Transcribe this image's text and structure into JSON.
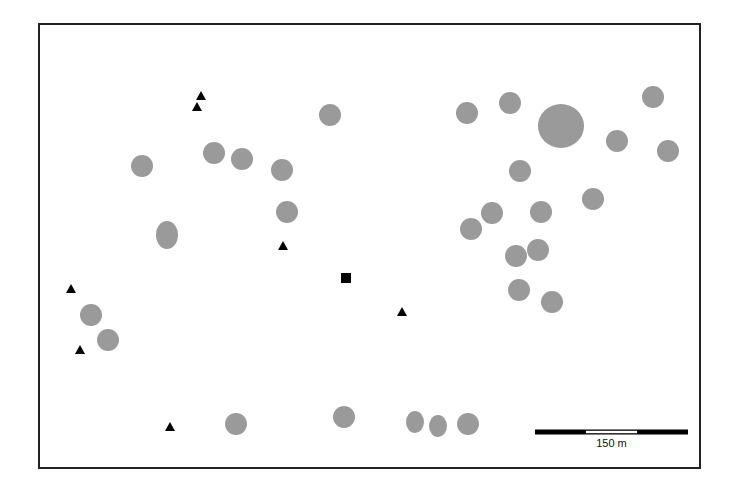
{
  "map": {
    "frame": {
      "x": 39,
      "y": 24,
      "width": 661,
      "height": 444
    },
    "colors": {
      "site": "#9a9a9a",
      "marker": "#000000",
      "frame": "#222222"
    },
    "sites": [
      {
        "x": 330,
        "y": 115,
        "rx": 11,
        "ry": 11
      },
      {
        "x": 142,
        "y": 166,
        "rx": 11,
        "ry": 11
      },
      {
        "x": 214,
        "y": 153,
        "rx": 11,
        "ry": 11
      },
      {
        "x": 242,
        "y": 159,
        "rx": 11,
        "ry": 11
      },
      {
        "x": 282,
        "y": 170,
        "rx": 11,
        "ry": 11
      },
      {
        "x": 287,
        "y": 212,
        "rx": 11,
        "ry": 11
      },
      {
        "x": 167,
        "y": 235,
        "rx": 11,
        "ry": 14
      },
      {
        "x": 91,
        "y": 315,
        "rx": 11,
        "ry": 11
      },
      {
        "x": 108,
        "y": 340,
        "rx": 11,
        "ry": 11
      },
      {
        "x": 467,
        "y": 113,
        "rx": 11,
        "ry": 11
      },
      {
        "x": 510,
        "y": 103,
        "rx": 11,
        "ry": 11
      },
      {
        "x": 561,
        "y": 126,
        "rx": 23,
        "ry": 22
      },
      {
        "x": 617,
        "y": 141,
        "rx": 11,
        "ry": 11
      },
      {
        "x": 653,
        "y": 97,
        "rx": 11,
        "ry": 11
      },
      {
        "x": 668,
        "y": 151,
        "rx": 11,
        "ry": 11
      },
      {
        "x": 520,
        "y": 171,
        "rx": 11,
        "ry": 11
      },
      {
        "x": 593,
        "y": 199,
        "rx": 11,
        "ry": 11
      },
      {
        "x": 492,
        "y": 213,
        "rx": 11,
        "ry": 11
      },
      {
        "x": 471,
        "y": 229,
        "rx": 11,
        "ry": 11
      },
      {
        "x": 541,
        "y": 212,
        "rx": 11,
        "ry": 11
      },
      {
        "x": 538,
        "y": 250,
        "rx": 11,
        "ry": 11
      },
      {
        "x": 516,
        "y": 256,
        "rx": 11,
        "ry": 11
      },
      {
        "x": 519,
        "y": 290,
        "rx": 11,
        "ry": 11
      },
      {
        "x": 552,
        "y": 302,
        "rx": 11,
        "ry": 11
      },
      {
        "x": 236,
        "y": 424,
        "rx": 11,
        "ry": 11
      },
      {
        "x": 344,
        "y": 417,
        "rx": 11,
        "ry": 11
      },
      {
        "x": 415,
        "y": 422,
        "rx": 9,
        "ry": 11
      },
      {
        "x": 438,
        "y": 426,
        "rx": 9,
        "ry": 11
      },
      {
        "x": 468,
        "y": 424,
        "rx": 11,
        "ry": 11
      }
    ],
    "triangles": [
      {
        "x": 201,
        "y": 96
      },
      {
        "x": 197,
        "y": 107
      },
      {
        "x": 283,
        "y": 246
      },
      {
        "x": 71,
        "y": 289
      },
      {
        "x": 80,
        "y": 350
      },
      {
        "x": 402,
        "y": 312
      },
      {
        "x": 170,
        "y": 427
      }
    ],
    "square": {
      "x": 346,
      "y": 278,
      "size": 10
    },
    "scale_bar": {
      "x1": 535,
      "x2": 688,
      "y": 432,
      "label": "150 m"
    }
  }
}
